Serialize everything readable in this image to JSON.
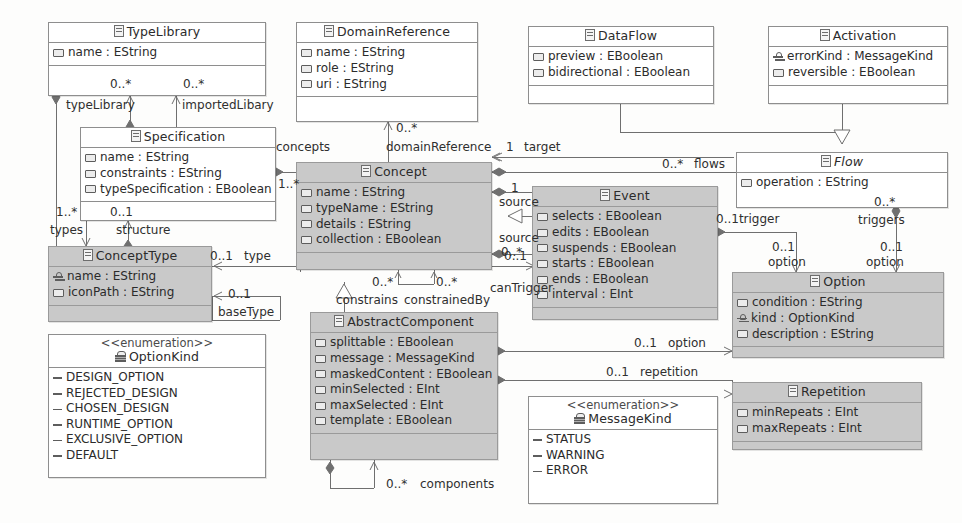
{
  "diagram": {
    "type": "uml-class-diagram",
    "stereotype_enumeration": "<<enumeration>>"
  },
  "classes": [
    {
      "id": "TypeLibrary",
      "name": "TypeLibrary",
      "abstract": false,
      "shaded": false,
      "x": 48,
      "y": 22,
      "w": 218,
      "h": 74,
      "attributes": [
        {
          "name": "name : EString",
          "kind": "attr"
        }
      ]
    },
    {
      "id": "DomainReference",
      "name": "DomainReference",
      "abstract": false,
      "shaded": false,
      "x": 296,
      "y": 22,
      "w": 182,
      "h": 100,
      "attributes": [
        {
          "name": "name : EString",
          "kind": "attr"
        },
        {
          "name": "role : EString",
          "kind": "attr"
        },
        {
          "name": "uri : EString",
          "kind": "attr"
        }
      ]
    },
    {
      "id": "DataFlow",
      "name": "DataFlow",
      "abstract": false,
      "shaded": false,
      "x": 528,
      "y": 26,
      "w": 186,
      "h": 78,
      "attributes": [
        {
          "name": "preview : EBoolean",
          "kind": "attr"
        },
        {
          "name": "bidirectional : EBoolean",
          "kind": "attr"
        }
      ]
    },
    {
      "id": "Activation",
      "name": "Activation",
      "abstract": false,
      "shaded": false,
      "x": 768,
      "y": 26,
      "w": 180,
      "h": 78,
      "attributes": [
        {
          "name": "errorKind : MessageKind",
          "kind": "attr-key"
        },
        {
          "name": "reversible : EBoolean",
          "kind": "attr"
        }
      ]
    },
    {
      "id": "Specification",
      "name": "Specification",
      "abstract": false,
      "shaded": false,
      "x": 80,
      "y": 127,
      "w": 196,
      "h": 94,
      "attributes": [
        {
          "name": "name : EString",
          "kind": "attr"
        },
        {
          "name": "constraints : EString",
          "kind": "attr"
        },
        {
          "name": "typeSpecification : EBoolean",
          "kind": "attr"
        }
      ]
    },
    {
      "id": "Concept",
      "name": "Concept",
      "abstract": false,
      "shaded": true,
      "x": 296,
      "y": 162,
      "w": 196,
      "h": 108,
      "attributes": [
        {
          "name": "name : EString",
          "kind": "attr"
        },
        {
          "name": "typeName : EString",
          "kind": "attr"
        },
        {
          "name": "details : EString",
          "kind": "attr"
        },
        {
          "name": "collection : EBoolean",
          "kind": "attr"
        }
      ]
    },
    {
      "id": "Flow",
      "name": "Flow",
      "abstract": true,
      "shaded": false,
      "x": 736,
      "y": 152,
      "w": 212,
      "h": 56,
      "attributes": [
        {
          "name": "operation : EString",
          "kind": "attr"
        }
      ]
    },
    {
      "id": "Event",
      "name": "Event",
      "abstract": false,
      "shaded": true,
      "x": 532,
      "y": 186,
      "w": 186,
      "h": 134,
      "attributes": [
        {
          "name": "selects : EBoolean",
          "kind": "attr"
        },
        {
          "name": "edits : EBoolean",
          "kind": "attr"
        },
        {
          "name": "suspends : EBoolean",
          "kind": "attr"
        },
        {
          "name": "starts : EBoolean",
          "kind": "attr"
        },
        {
          "name": "ends : EBoolean",
          "kind": "attr"
        },
        {
          "name": "interval : EInt",
          "kind": "attr"
        }
      ]
    },
    {
      "id": "ConceptType",
      "name": "ConceptType",
      "abstract": false,
      "shaded": true,
      "x": 48,
      "y": 246,
      "w": 164,
      "h": 76,
      "attributes": [
        {
          "name": "name : EString",
          "kind": "attr-key"
        },
        {
          "name": "iconPath : EString",
          "kind": "attr"
        }
      ]
    },
    {
      "id": "Option",
      "name": "Option",
      "abstract": false,
      "shaded": true,
      "x": 732,
      "y": 272,
      "w": 212,
      "h": 86,
      "attributes": [
        {
          "name": "condition : EString",
          "kind": "attr"
        },
        {
          "name": "kind : OptionKind",
          "kind": "attr-key"
        },
        {
          "name": "description : EString",
          "kind": "attr"
        }
      ]
    },
    {
      "id": "AbstractComponent",
      "name": "AbstractComponent",
      "abstract": false,
      "shaded": true,
      "x": 310,
      "y": 312,
      "w": 188,
      "h": 148,
      "attributes": [
        {
          "name": "splittable : EBoolean",
          "kind": "attr"
        },
        {
          "name": "message : MessageKind",
          "kind": "attr"
        },
        {
          "name": "maskedContent : EBoolean",
          "kind": "attr"
        },
        {
          "name": "minSelected : EInt",
          "kind": "attr"
        },
        {
          "name": "maxSelected : EInt",
          "kind": "attr"
        },
        {
          "name": "template : EBoolean",
          "kind": "attr"
        }
      ]
    },
    {
      "id": "Repetition",
      "name": "Repetition",
      "abstract": false,
      "shaded": true,
      "x": 732,
      "y": 382,
      "w": 190,
      "h": 68,
      "attributes": [
        {
          "name": "minRepeats : EInt",
          "kind": "attr"
        },
        {
          "name": "maxRepeats : EInt",
          "kind": "attr"
        }
      ]
    }
  ],
  "enumerations": [
    {
      "id": "OptionKind",
      "name": "OptionKind",
      "x": 48,
      "y": 334,
      "w": 218,
      "h": 144,
      "literals": [
        "DESIGN_OPTION",
        "REJECTED_DESIGN",
        "CHOSEN_DESIGN",
        "RUNTIME_OPTION",
        "EXCLUSIVE_OPTION",
        "DEFAULT"
      ]
    },
    {
      "id": "MessageKind",
      "name": "MessageKind",
      "x": 528,
      "y": 396,
      "w": 190,
      "h": 108,
      "literals": [
        "STATUS",
        "WARNING",
        "ERROR"
      ]
    }
  ],
  "edge_labels": [
    {
      "id": "l-typeLibrary-mult",
      "text": "0..*",
      "x": 110,
      "y": 84
    },
    {
      "id": "l-importedLibary-mult",
      "text": "0..*",
      "x": 178,
      "y": 84
    },
    {
      "id": "l-typeLibrary",
      "text": "typeLibrary",
      "x": 66,
      "y": 99
    },
    {
      "id": "l-importedLibary",
      "text": "importedLibary",
      "x": 168,
      "y": 99
    },
    {
      "id": "l-types-mult",
      "text": "1..*",
      "x": 56,
      "y": 212
    },
    {
      "id": "l-structure-mult",
      "text": "0..1",
      "x": 118,
      "y": 212
    },
    {
      "id": "l-types",
      "text": "types",
      "x": 50,
      "y": 228
    },
    {
      "id": "l-structure",
      "text": "structure",
      "x": 116,
      "y": 228
    },
    {
      "id": "l-concepts",
      "text": "concepts",
      "x": 276,
      "y": 145
    },
    {
      "id": "l-concepts-mult",
      "text": "1..*",
      "x": 278,
      "y": 180
    },
    {
      "id": "l-domainRef-mult",
      "text": "0..*",
      "x": 398,
      "y": 128
    },
    {
      "id": "l-domainReference",
      "text": "domainReference",
      "x": 386,
      "y": 145
    },
    {
      "id": "l-target-mult",
      "text": "1",
      "x": 502,
      "y": 145
    },
    {
      "id": "l-target",
      "text": "target",
      "x": 516,
      "y": 145
    },
    {
      "id": "l-source1-mult",
      "text": "1",
      "x": 502,
      "y": 183
    },
    {
      "id": "l-source1",
      "text": "source",
      "x": 496,
      "y": 196
    },
    {
      "id": "l-source2",
      "text": "source",
      "x": 496,
      "y": 232
    },
    {
      "id": "l-source2-mult",
      "text": "0..*",
      "x": 498,
      "y": 246
    },
    {
      "id": "l-flows-mult",
      "text": "0..*",
      "x": 664,
      "y": 161
    },
    {
      "id": "l-flows",
      "text": "flows",
      "x": 694,
      "y": 161
    },
    {
      "id": "l-trigger",
      "text": "0..1trigger",
      "x": 718,
      "y": 218
    },
    {
      "id": "l-triggers-mult",
      "text": "0..*",
      "x": 872,
      "y": 200
    },
    {
      "id": "l-triggers",
      "text": "triggers",
      "x": 860,
      "y": 216
    },
    {
      "id": "l-canTrigger-mult",
      "text": "0..1",
      "x": 506,
      "y": 252
    },
    {
      "id": "l-canTrigger",
      "text": "canTrigger",
      "x": 492,
      "y": 284
    },
    {
      "id": "l-option1-mult",
      "text": "0..1",
      "x": 768,
      "y": 244
    },
    {
      "id": "l-option1",
      "text": "option",
      "x": 766,
      "y": 258
    },
    {
      "id": "l-option2-mult",
      "text": "0..1",
      "x": 886,
      "y": 244
    },
    {
      "id": "l-option2",
      "text": "option",
      "x": 876,
      "y": 258
    },
    {
      "id": "l-type-mult",
      "text": "0..1",
      "x": 206,
      "y": 251
    },
    {
      "id": "l-type",
      "text": "type",
      "x": 240,
      "y": 251
    },
    {
      "id": "l-baseType-mult",
      "text": "0..1",
      "x": 228,
      "y": 289
    },
    {
      "id": "l-baseType",
      "text": "baseType",
      "x": 218,
      "y": 306
    },
    {
      "id": "l-constrains-mult",
      "text": "0..*",
      "x": 372,
      "y": 281
    },
    {
      "id": "l-constrainedBy-mult",
      "text": "0..*",
      "x": 424,
      "y": 281
    },
    {
      "id": "l-constrains",
      "text": "constrains",
      "x": 338,
      "y": 297
    },
    {
      "id": "l-constrainedBy",
      "text": "constrainedBy",
      "x": 398,
      "y": 297
    },
    {
      "id": "l-option3-mult",
      "text": "0..1",
      "x": 634,
      "y": 341
    },
    {
      "id": "l-option3",
      "text": "option",
      "x": 668,
      "y": 341
    },
    {
      "id": "l-repetition-mult",
      "text": "0..1",
      "x": 606,
      "y": 369
    },
    {
      "id": "l-repetition",
      "text": "repetition",
      "x": 640,
      "y": 369
    },
    {
      "id": "l-components-mult",
      "text": "0..*",
      "x": 378,
      "y": 481
    },
    {
      "id": "l-components",
      "text": "components",
      "x": 412,
      "y": 481
    }
  ],
  "colors": {
    "shaded_fill": "#c9c9c9",
    "plain_fill": "#ffffff",
    "border": "#8e8e8e",
    "line": "#6f6f6f",
    "text": "#2b2b2b",
    "page_bg": "#fdfdfc"
  }
}
